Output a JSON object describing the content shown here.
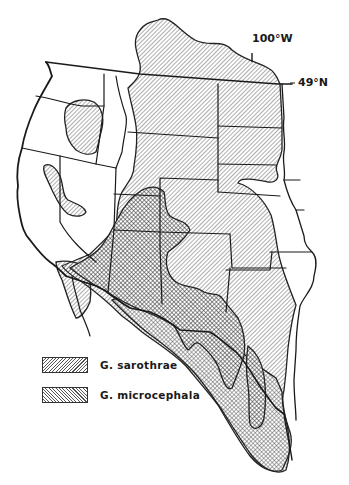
{
  "map": {
    "subject": "Distribution of Gutierrezia sarothrae and G. microcephala",
    "labels": {
      "longitude": "100°W",
      "latitude": "49°N"
    },
    "legend": [
      {
        "id": "sarothrae",
        "label": "G. sarothrae",
        "pattern": "diagonal-hatch-right"
      },
      {
        "id": "microcephala",
        "label": "G. microcephala",
        "pattern": "diagonal-hatch-left"
      }
    ],
    "overlap_pattern": "crosshatch",
    "colors": {
      "ink": "#1a1a1a",
      "hatch": "#555555",
      "background": "#ffffff"
    }
  }
}
